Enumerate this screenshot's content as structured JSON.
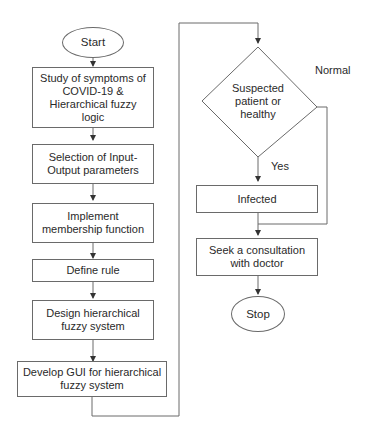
{
  "flowchart": {
    "left_column": {
      "start": "Start",
      "steps": [
        "Study of symptoms of COVID-19 & Hierarchical fuzzy logic",
        "Selection of Input-Output parameters",
        "Implement membership function",
        "Define rule",
        "Design hierarchical fuzzy system",
        "Develop GUI for hierarchical fuzzy system"
      ]
    },
    "right_column": {
      "decision": "Suspected patient or healthy",
      "yes_label": "Yes",
      "normal_label": "Normal",
      "infected": "Infected",
      "consult": "Seek a consultation with doctor",
      "stop": "Stop"
    },
    "colors": {
      "stroke": "#6a6a6a",
      "text": "#2a2a2a",
      "background": "#ffffff"
    }
  }
}
